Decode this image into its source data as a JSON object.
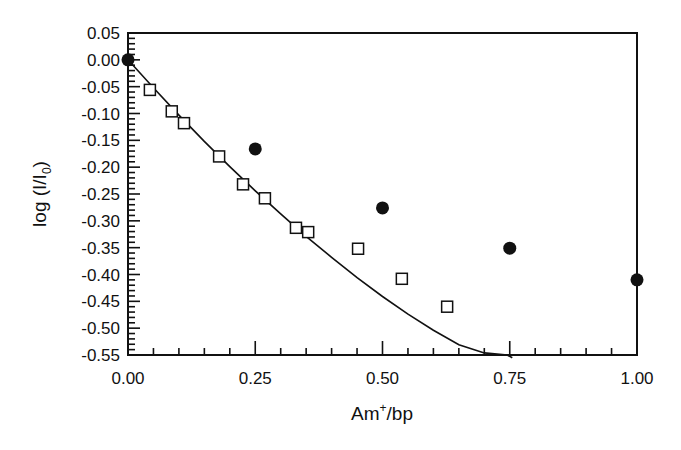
{
  "chart_data": {
    "type": "scatter",
    "title": "",
    "xlabel": "Am+/bp",
    "xlabel_main": "Am",
    "xlabel_sup": "+",
    "xlabel_tail": "/bp",
    "ylabel": "log (I/I0)",
    "ylabel_main": "log (I/I",
    "ylabel_sub": "0",
    "ylabel_tail": ")",
    "xlim": [
      0.0,
      1.0
    ],
    "ylim": [
      -0.55,
      0.05
    ],
    "grid": false,
    "legend": null,
    "x_ticks": [
      "0.00",
      "0.25",
      "0.50",
      "0.75",
      "1.00"
    ],
    "x_tick_values": [
      0.0,
      0.25,
      0.5,
      0.75,
      1.0
    ],
    "x_minor_step": 0.05,
    "y_ticks": [
      "0.05",
      "0.00",
      "-0.05",
      "-0.10",
      "-0.15",
      "-0.20",
      "-0.25",
      "-0.30",
      "-0.35",
      "-0.40",
      "-0.45",
      "-0.50",
      "-0.55"
    ],
    "y_tick_values": [
      0.05,
      0.0,
      -0.05,
      -0.1,
      -0.15,
      -0.2,
      -0.25,
      -0.3,
      -0.35,
      -0.4,
      -0.45,
      -0.5,
      -0.55
    ],
    "y_minor_step": 0.01,
    "series": [
      {
        "name": "open squares",
        "marker": "open-square",
        "x": [
          0.043,
          0.086,
          0.11,
          0.179,
          0.226,
          0.269,
          0.33,
          0.354,
          0.452,
          0.538,
          0.627
        ],
        "y": [
          -0.056,
          -0.096,
          -0.118,
          -0.18,
          -0.232,
          -0.258,
          -0.313,
          -0.321,
          -0.352,
          -0.408,
          -0.46
        ]
      },
      {
        "name": "filled circles",
        "marker": "filled-circle",
        "x": [
          0.0,
          0.25,
          0.5,
          0.75,
          1.0
        ],
        "y": [
          0.0,
          -0.166,
          -0.276,
          -0.351,
          -0.41
        ]
      },
      {
        "name": "fit curve",
        "marker": "line",
        "x": [
          0.0,
          0.05,
          0.1,
          0.15,
          0.2,
          0.25,
          0.3,
          0.35,
          0.4,
          0.45,
          0.5,
          0.55,
          0.6,
          0.65,
          0.7,
          0.745,
          0.755
        ],
        "y": [
          0.0,
          -0.052,
          -0.103,
          -0.152,
          -0.199,
          -0.244,
          -0.287,
          -0.329,
          -0.368,
          -0.406,
          -0.441,
          -0.474,
          -0.504,
          -0.531,
          -0.546,
          -0.55,
          -0.555
        ]
      }
    ]
  }
}
